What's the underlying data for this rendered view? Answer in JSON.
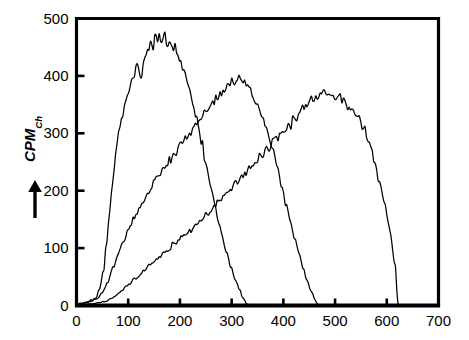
{
  "figure": {
    "background_color": "#ffffff",
    "line_color": "#000000",
    "axis_color": "#000000"
  },
  "axes": {
    "y_title_main": "CPM",
    "y_title_sub": "Ch",
    "y_arrow_icon": "up-arrow-icon",
    "y_ticks": [
      "0",
      "100",
      "200",
      "300",
      "400",
      "500"
    ],
    "x_ticks": [
      "0",
      "100",
      "200",
      "300",
      "400",
      "500",
      "600",
      "700"
    ]
  },
  "chart_data": {
    "type": "line",
    "title": "",
    "subtitle": "",
    "xlabel": "",
    "ylabel": "CPM_Ch",
    "xlim": [
      0,
      700
    ],
    "ylim": [
      0,
      500
    ],
    "xticks": [
      0,
      100,
      200,
      300,
      400,
      500,
      600,
      700
    ],
    "yticks": [
      0,
      100,
      200,
      300,
      400,
      500
    ],
    "grid": false,
    "legend": null,
    "legend_position": "none",
    "frame": "top-left-right-bottom",
    "annotations": [],
    "series": [
      {
        "name": "peak-1",
        "color": "#000000",
        "peak_x": 175,
        "peak_y": 470,
        "onset_x": 35,
        "end_x": 332,
        "x": [
          0,
          10,
          20,
          30,
          38,
          45,
          52,
          58,
          64,
          70,
          76,
          82,
          88,
          94,
          100,
          106,
          112,
          118,
          124,
          130,
          136,
          140,
          144,
          148,
          152,
          156,
          160,
          164,
          168,
          172,
          176,
          180,
          184,
          188,
          192,
          196,
          200,
          206,
          212,
          218,
          224,
          230,
          236,
          242,
          250,
          258,
          266,
          274,
          282,
          290,
          298,
          306,
          314,
          322,
          330,
          340
        ],
        "y": [
          3,
          4,
          6,
          9,
          14,
          30,
          62,
          110,
          165,
          218,
          262,
          300,
          330,
          352,
          372,
          390,
          404,
          420,
          398,
          424,
          440,
          452,
          460,
          455,
          468,
          462,
          472,
          463,
          470,
          466,
          458,
          462,
          452,
          446,
          449,
          436,
          428,
          412,
          396,
          378,
          358,
          334,
          310,
          284,
          248,
          214,
          180,
          148,
          118,
          92,
          68,
          48,
          30,
          14,
          2,
          0
        ]
      },
      {
        "name": "peak-2",
        "color": "#000000",
        "peak_x": 320,
        "peak_y": 396,
        "onset_x": 45,
        "end_x": 468,
        "x": [
          0,
          10,
          20,
          30,
          40,
          50,
          60,
          70,
          80,
          90,
          100,
          110,
          120,
          130,
          140,
          150,
          160,
          170,
          180,
          190,
          200,
          210,
          220,
          230,
          240,
          250,
          258,
          266,
          274,
          282,
          290,
          298,
          306,
          312,
          318,
          324,
          330,
          336,
          342,
          350,
          358,
          366,
          374,
          382,
          390,
          398,
          406,
          414,
          422,
          430,
          438,
          446,
          454,
          462,
          468,
          480
        ],
        "y": [
          2,
          3,
          5,
          8,
          12,
          22,
          40,
          64,
          88,
          110,
          132,
          150,
          168,
          184,
          198,
          214,
          228,
          240,
          252,
          266,
          278,
          290,
          300,
          312,
          324,
          336,
          346,
          356,
          364,
          372,
          380,
          388,
          392,
          396,
          392,
          388,
          384,
          376,
          366,
          352,
          334,
          312,
          288,
          262,
          234,
          204,
          174,
          145,
          116,
          90,
          66,
          44,
          24,
          8,
          0,
          0
        ]
      },
      {
        "name": "peak-3",
        "color": "#000000",
        "peak_x": 470,
        "peak_y": 372,
        "onset_x": 55,
        "end_x": 620,
        "x": [
          0,
          15,
          30,
          45,
          58,
          70,
          85,
          100,
          115,
          130,
          145,
          160,
          175,
          190,
          205,
          220,
          235,
          250,
          265,
          280,
          295,
          310,
          325,
          340,
          355,
          370,
          385,
          400,
          412,
          424,
          436,
          446,
          456,
          464,
          472,
          480,
          488,
          496,
          506,
          516,
          526,
          536,
          546,
          556,
          566,
          576,
          586,
          596,
          606,
          616,
          622,
          640
        ],
        "y": [
          1,
          2,
          3,
          5,
          8,
          14,
          24,
          36,
          48,
          60,
          72,
          84,
          96,
          108,
          120,
          132,
          144,
          158,
          172,
          186,
          200,
          214,
          228,
          244,
          258,
          272,
          288,
          302,
          314,
          328,
          340,
          350,
          360,
          366,
          372,
          368,
          370,
          366,
          362,
          356,
          348,
          338,
          324,
          306,
          282,
          252,
          216,
          176,
          130,
          70,
          0,
          0
        ]
      }
    ]
  }
}
